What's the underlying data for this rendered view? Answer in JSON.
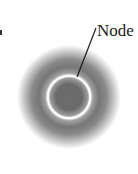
{
  "diagram": {
    "title": "",
    "type": "orbital-cross-section",
    "label": "Node",
    "colors": {
      "density_dark": "#5a5a5a",
      "density_mid": "#8c8c8c",
      "node_ring": "#ffffff",
      "leader_line": "#1a1a1a",
      "background": "#ffffff"
    },
    "geometry": {
      "center": [
        69,
        97
      ],
      "outer_radius": 50,
      "node_radius": 21
    }
  }
}
